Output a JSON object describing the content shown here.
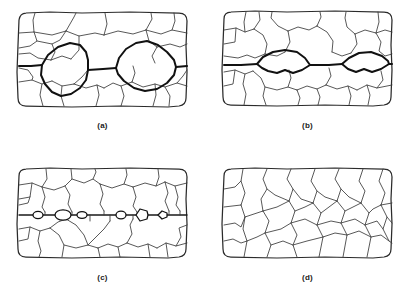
{
  "figure": {
    "background_color": "#ffffff",
    "line_color": "#3a3a3a",
    "emphasis_color": "#111111",
    "panel_count": 4,
    "layout": "2x2 grid"
  },
  "panels": [
    {
      "id": "a",
      "label": "(a)",
      "position": "top-left",
      "description": "Polycrystalline grain structure with two large coalesced cavities outlined in bold on a horizontal grain boundary",
      "feature": "large-coalesced-cavities",
      "cavity_count": 2,
      "boundary_line": "horizontal-mid",
      "grain_count": 22
    },
    {
      "id": "b",
      "label": "(b)",
      "position": "top-right",
      "description": "Grain structure with two flattened lens-shaped cavities along a bold horizontal grain boundary",
      "feature": "lens-shaped-cavities",
      "cavity_count": 2,
      "boundary_line": "horizontal-mid",
      "grain_count": 22
    },
    {
      "id": "c",
      "label": "(c)",
      "position": "bottom-left",
      "description": "Grain structure with a row of small discrete voids nucleated along a straight horizontal grain boundary",
      "feature": "small-discrete-voids",
      "cavity_count": 6,
      "boundary_line": "horizontal-straight",
      "grain_count": 24
    },
    {
      "id": "d",
      "label": "(d)",
      "position": "bottom-right",
      "description": "Uniform undamaged polycrystalline grain structure with no cavities",
      "feature": "no-cavities",
      "cavity_count": 0,
      "boundary_line": "none",
      "grain_count": 24
    }
  ]
}
